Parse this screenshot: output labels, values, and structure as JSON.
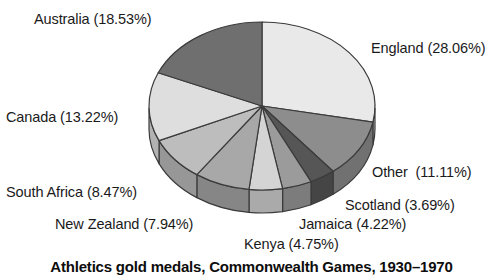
{
  "chart_data": {
    "type": "pie",
    "title": "Athletics gold medals, Commonwealth Games, 1930–1970",
    "xlabel": "",
    "ylabel": "",
    "legend_position": "none",
    "grid": false,
    "labels_outside": true,
    "start_angle_deg": 0,
    "direction": "clockwise",
    "style": "3d-elliptical",
    "categories": [
      "England",
      "Other",
      "Scotland",
      "Jamaica",
      "Kenya",
      "New Zealand",
      "South Africa",
      "Canada",
      "Australia"
    ],
    "values": [
      28.06,
      11.11,
      3.69,
      4.22,
      4.75,
      7.94,
      8.47,
      13.22,
      18.53
    ],
    "units": "%",
    "slice_colors": [
      "#e9e9e9",
      "#8d8d8d",
      "#565656",
      "#9b9b9b",
      "#d4d4d4",
      "#a8a8a8",
      "#bdbdbd",
      "#dedede",
      "#6f6f6f"
    ],
    "annotations": [
      "Australia (18.53%)",
      "England (28.06%)",
      "Canada (13.22%)",
      "Other  (11.11%)",
      "South Africa (8.47%)",
      "Scotland (3.69%)",
      "New Zealand (7.94%)",
      "Jamaica (4.22%)",
      "Kenya (4.75%)"
    ]
  },
  "chart": {
    "caption": "Athletics gold medals, Commonwealth Games, 1930–1970",
    "labels": {
      "australia": "Australia (18.53%)",
      "england": "England (28.06%)",
      "canada": "Canada (13.22%)",
      "other": "Other  (11.11%)",
      "south_africa": "South Africa (8.47%)",
      "scotland": "Scotland (3.69%)",
      "new_zealand": "New Zealand (7.94%)",
      "jamaica": "Jamaica (4.22%)",
      "kenya": "Kenya (4.75%)"
    }
  },
  "colors": {
    "outline": "#3b3b3b",
    "text": "#1a1a1a",
    "caption": "#0d0d0d",
    "background": "#ffffff"
  }
}
